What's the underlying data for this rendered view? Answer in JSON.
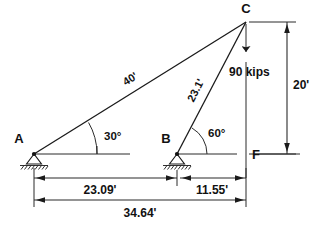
{
  "diagram": {
    "type": "statics-free-body-diagram",
    "nodes": [
      {
        "id": "A",
        "label": "A",
        "support": "pin",
        "x": 34,
        "y": 154
      },
      {
        "id": "B",
        "label": "B",
        "support": "pin",
        "x": 177,
        "y": 154
      },
      {
        "id": "C",
        "label": "C",
        "support": "none",
        "x": 246,
        "y": 22
      },
      {
        "id": "F",
        "label": "F",
        "support": "none",
        "x": 246,
        "y": 154
      }
    ],
    "members": [
      {
        "from": "A",
        "to": "C",
        "length_label": "40'",
        "angle_deg": 30
      },
      {
        "from": "B",
        "to": "C",
        "length_label": "23.1'",
        "angle_deg": 60
      }
    ],
    "angles": [
      {
        "at": "A",
        "label": "30°",
        "value": 30
      },
      {
        "at": "B",
        "label": "60°",
        "value": 60
      }
    ],
    "load": {
      "label": "90 kips",
      "magnitude": 90,
      "unit": "kips",
      "direction": "down",
      "applied_at": "C"
    },
    "dimensions": [
      {
        "name": "A-to-B",
        "label": "23.09'",
        "value": 23.09,
        "orientation": "horizontal"
      },
      {
        "name": "B-to-F",
        "label": "11.55'",
        "value": 11.55,
        "orientation": "horizontal"
      },
      {
        "name": "A-to-F",
        "label": "34.64'",
        "value": 34.64,
        "orientation": "horizontal"
      },
      {
        "name": "C-to-F",
        "label": "20'",
        "value": 20,
        "orientation": "vertical"
      }
    ],
    "colors": {
      "line": "#1a1a1a",
      "thin_line": "#2b2b2b",
      "background": "#ffffff",
      "text": "#111111"
    }
  }
}
